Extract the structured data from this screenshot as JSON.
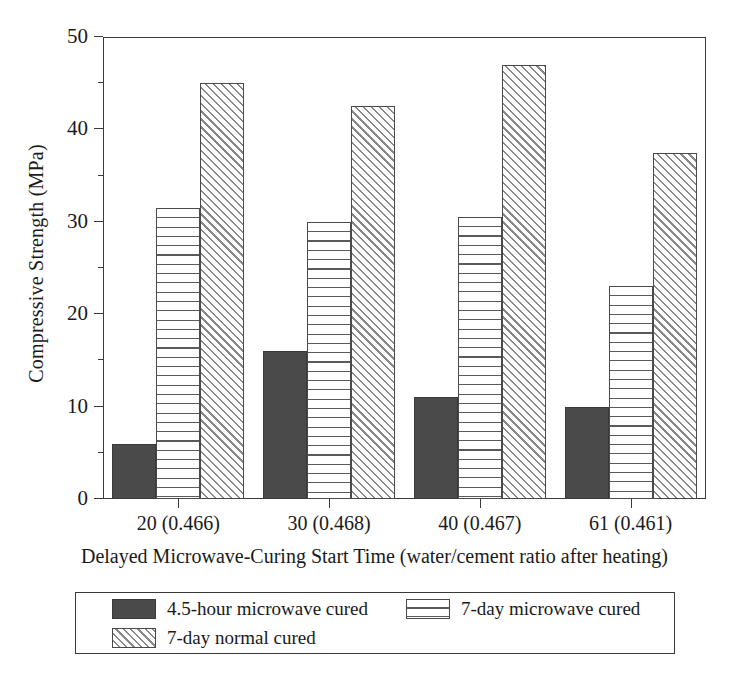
{
  "chart_data": {
    "type": "bar",
    "title": "",
    "subtitle": "",
    "xlabel": "Delayed Microwave-Curing Start Time (water/cement ratio after heating)",
    "ylabel": "Compressive Strength (MPa)",
    "categories": [
      "20 (0.466)",
      "30 (0.468)",
      "40 (0.467)",
      "61 (0.461)"
    ],
    "series": [
      {
        "name": "4.5-hour microwave cured",
        "pattern": "solid-dark",
        "values": [
          6.0,
          16.0,
          11.0,
          10.0
        ]
      },
      {
        "name": "7-day microwave cured",
        "pattern": "horizontal-lines",
        "values": [
          31.5,
          30.0,
          30.5,
          23.0
        ]
      },
      {
        "name": "7-day normal cured",
        "pattern": "diagonal-hatch",
        "values": [
          45.0,
          42.5,
          47.0,
          37.5
        ]
      }
    ],
    "ylim": [
      0,
      50
    ],
    "y_major_ticks": [
      0,
      10,
      20,
      30,
      40,
      50
    ],
    "y_minor_ticks": [
      5,
      15,
      25,
      35,
      45
    ],
    "grid": false,
    "legend_position": "bottom",
    "colors": {
      "series1_fill": "#4a4a4a",
      "series2_fill": "#ffffff",
      "series3_fill": "#ffffff",
      "hatch_line": "#5a5a5a",
      "axis": "#3a3a3a",
      "text": "#1a1a1a",
      "background": "#ffffff"
    }
  },
  "axis": {
    "y_tick_labels": [
      "0",
      "10",
      "20",
      "30",
      "40",
      "50"
    ],
    "y_title": "Compressive Strength (MPa)",
    "x_tick_labels": [
      "20 (0.466)",
      "30 (0.468)",
      "40 (0.467)",
      "61 (0.461)"
    ],
    "x_title": "Delayed Microwave-Curing Start Time (water/cement ratio after heating)"
  },
  "legend": {
    "items": [
      {
        "label": "4.5-hour microwave cured",
        "pattern": "solid-dark"
      },
      {
        "label": "7-day microwave cured",
        "pattern": "horizontal-lines"
      },
      {
        "label": "7-day normal cured",
        "pattern": "diagonal-hatch"
      }
    ]
  }
}
